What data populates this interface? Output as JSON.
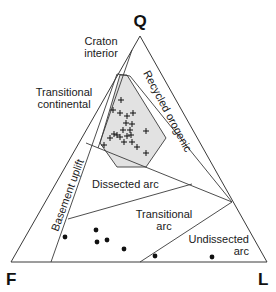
{
  "diagram": {
    "type": "ternary",
    "vertices": {
      "top": "Q",
      "left": "F",
      "right": "L"
    },
    "fields": [
      {
        "name": "craton_interior",
        "label_lines": [
          "Craton",
          "interior"
        ]
      },
      {
        "name": "transitional_continental",
        "label_lines": [
          "Transitional",
          "continental"
        ]
      },
      {
        "name": "basement_uplift",
        "label": "Basement uplift"
      },
      {
        "name": "recycled_orogenic",
        "label": "Recycled orogenic"
      },
      {
        "name": "dissected_arc",
        "label": "Dissected arc"
      },
      {
        "name": "transitional_arc",
        "label_lines": [
          "Transitional",
          "arc"
        ]
      },
      {
        "name": "undissected_arc",
        "label_lines": [
          "Undissected",
          "arc"
        ]
      }
    ],
    "colors": {
      "line": "#3a3a3a",
      "shaded_field": "#e2e2e2",
      "marker": "#111111"
    },
    "series": [
      {
        "name": "cross markers",
        "marker": "+",
        "points_px": [
          [
            121,
            100
          ],
          [
            113,
            110
          ],
          [
            120,
            113
          ],
          [
            127,
            116
          ],
          [
            133,
            113
          ],
          [
            126,
            123
          ],
          [
            132,
            124
          ],
          [
            123,
            130
          ],
          [
            130,
            130
          ],
          [
            114,
            134
          ],
          [
            117,
            135
          ],
          [
            120,
            137
          ],
          [
            127,
            136
          ],
          [
            131,
            135
          ],
          [
            110,
            138
          ],
          [
            124,
            142
          ],
          [
            132,
            142
          ],
          [
            146,
            131
          ],
          [
            137,
            147
          ],
          [
            146,
            153
          ],
          [
            104,
            145
          ]
        ]
      },
      {
        "name": "dot markers",
        "marker": "dot",
        "points_px": [
          [
            65,
            237
          ],
          [
            96,
            230
          ],
          [
            97,
            242
          ],
          [
            107,
            240
          ],
          [
            124,
            249
          ],
          [
            155,
            256
          ],
          [
            212,
            257
          ]
        ]
      }
    ]
  }
}
